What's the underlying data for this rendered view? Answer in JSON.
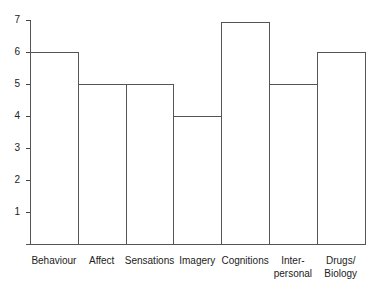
{
  "chart_data": {
    "type": "bar",
    "title": "",
    "xlabel": "",
    "ylabel": "",
    "ylim": [
      0,
      7
    ],
    "yticks": [
      "1",
      "2",
      "3",
      "4",
      "5",
      "6",
      "7"
    ],
    "grid": false,
    "categories": [
      "Behaviour",
      "Affect",
      "Sensations",
      "Imagery",
      "Cognitions",
      "Inter-\npersonal",
      "Drugs/\nBiology"
    ],
    "values": [
      6,
      5,
      5,
      4,
      7,
      5,
      6
    ]
  }
}
